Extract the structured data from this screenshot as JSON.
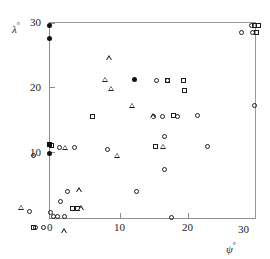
{
  "chart_data": {
    "type": "scatter",
    "title": "",
    "subtitle": "",
    "xlabel": "ψ°",
    "ylabel": "λ°",
    "xlabel_base": "ψ",
    "ylabel_base": "λ",
    "degree_symbol": "°",
    "xlim": [
      -3,
      31
    ],
    "ylim": [
      -2,
      31
    ],
    "xticks": [
      0,
      10,
      20,
      30
    ],
    "xtick_labels": [
      "0",
      "10",
      "20",
      "30"
    ],
    "yticks": [
      10,
      20,
      30
    ],
    "ytick_labels": [
      "10",
      "20",
      "30"
    ],
    "grid": false,
    "legend": false,
    "legend_position": "none",
    "frame": {
      "x_left": 0,
      "x_right": 30,
      "y_bottom": 0,
      "y_top": 30
    },
    "marker_types": [
      "open-circle",
      "filled-circle",
      "open-square",
      "filled-square",
      "open-triangle"
    ],
    "series": [
      {
        "name": "open-circle",
        "marker": "open-circle",
        "points": [
          [
            -2.4,
            9.6
          ],
          [
            -3.0,
            1.0
          ],
          [
            -2.0,
            -1.4
          ],
          [
            -0.9,
            -1.4
          ],
          [
            0.2,
            0.9
          ],
          [
            0.5,
            0.2
          ],
          [
            1.2,
            0.2
          ],
          [
            2.2,
            0.2
          ],
          [
            1.6,
            2.6
          ],
          [
            2.6,
            4.1
          ],
          [
            1.5,
            10.8
          ],
          [
            3.6,
            10.8
          ],
          [
            8.5,
            10.6
          ],
          [
            12.6,
            4.1
          ],
          [
            15.2,
            15.6
          ],
          [
            16.4,
            15.6
          ],
          [
            18.6,
            15.6
          ],
          [
            21.6,
            15.7
          ],
          [
            15.6,
            21.2
          ],
          [
            17.2,
            21.2
          ],
          [
            16.8,
            12.6
          ],
          [
            16.8,
            7.4
          ],
          [
            23.0,
            11.0
          ],
          [
            28.0,
            28.6
          ],
          [
            29.6,
            28.6
          ],
          [
            29.4,
            29.6
          ],
          [
            17.8,
            0.1
          ],
          [
            29.8,
            17.3
          ]
        ]
      },
      {
        "name": "filled-circle",
        "marker": "filled-circle",
        "points": [
          [
            0.0,
            29.6
          ],
          [
            0.0,
            27.6
          ],
          [
            0.0,
            9.9
          ],
          [
            12.4,
            21.3
          ]
        ]
      },
      {
        "name": "open-square",
        "marker": "open-square",
        "points": [
          [
            -2.4,
            -1.4
          ],
          [
            3.4,
            1.5
          ],
          [
            4.1,
            1.5
          ],
          [
            6.2,
            15.6
          ],
          [
            17.2,
            21.2
          ],
          [
            19.5,
            21.2
          ],
          [
            19.7,
            19.6
          ],
          [
            18.0,
            15.7
          ],
          [
            15.4,
            11.0
          ],
          [
            0.3,
            11.2
          ],
          [
            29.9,
            29.6
          ],
          [
            30.4,
            29.6
          ],
          [
            30.1,
            28.6
          ]
        ]
      },
      {
        "name": "filled-square",
        "marker": "filled-square",
        "points": [
          [
            0.0,
            11.3
          ]
        ]
      },
      {
        "name": "open-triangle",
        "marker": "open-triangle",
        "points": [
          [
            -4.2,
            1.6
          ],
          [
            2.1,
            -2.0
          ],
          [
            4.6,
            1.5
          ],
          [
            2.3,
            10.8
          ],
          [
            9.8,
            9.6
          ],
          [
            8.1,
            21.3
          ],
          [
            9.0,
            19.9
          ],
          [
            8.7,
            24.6
          ],
          [
            12.0,
            17.3
          ],
          [
            15.0,
            15.7
          ],
          [
            16.6,
            11.0
          ],
          [
            4.3,
            4.3
          ]
        ]
      }
    ]
  }
}
